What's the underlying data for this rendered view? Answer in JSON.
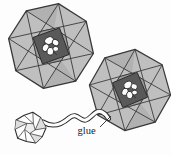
{
  "diagram": {
    "glue_label": "glue",
    "colors": {
      "background": "#fdfdfd",
      "flap_gray": "#bfbfbf",
      "inner_ring_gray": "#9d9d9d",
      "center_square_gray": "#595959",
      "outline_dark": "#2b2b2b",
      "paper_white": "#fcfcfc"
    },
    "elements": [
      "origami-twist-module-upper-left",
      "origami-twist-module-lower-right",
      "crumpled-paper-ball",
      "glue-tube",
      "glue-leader-line",
      "glue-label"
    ]
  }
}
